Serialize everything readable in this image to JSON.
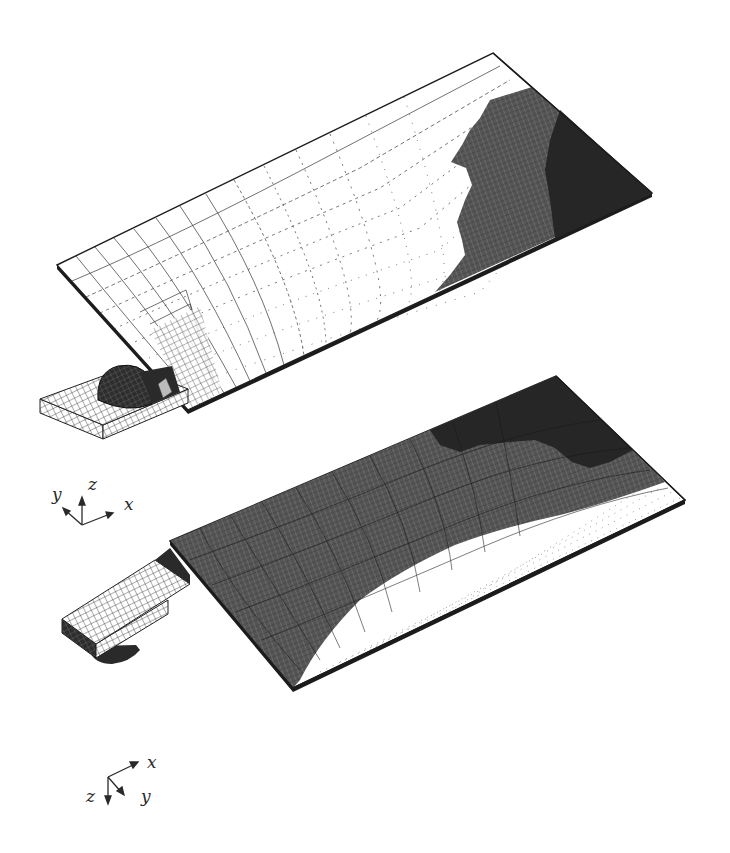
{
  "figure": {
    "background": "#ffffff",
    "ink_color": "#1c1c1c",
    "dark_region_color": "#262626",
    "mid_region_color": "#3a3a3a",
    "mesh_color": "#333333",
    "top_view": {
      "label": "Top view of plate with attached tab and hemispherical joint (mesh)",
      "plate_corners": {
        "left": [
          57,
          265
        ],
        "top": [
          493,
          53
        ],
        "right": [
          652,
          193
        ],
        "bottom": [
          188,
          410
        ]
      },
      "axes": {
        "x": "x",
        "y": "y",
        "z": "z"
      }
    },
    "bottom_view": {
      "label": "Bottom view of plate with attached tab (deformed mesh)",
      "plate_corners": {
        "left": [
          170,
          540
        ],
        "top": [
          556,
          376
        ],
        "right": [
          685,
          500
        ],
        "bottom": [
          293,
          688
        ]
      },
      "axes": {
        "x": "x",
        "y": "y",
        "z": "z"
      }
    }
  }
}
